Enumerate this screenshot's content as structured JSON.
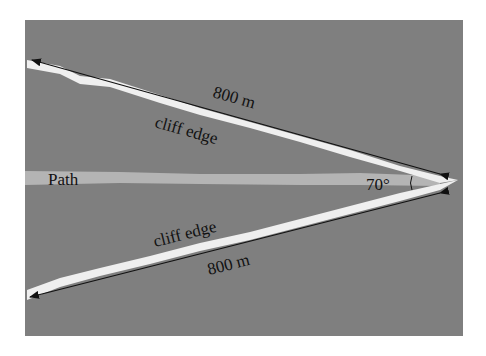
{
  "diagram": {
    "background_color": "#7f7f7f",
    "path_color": "#b4b4b4",
    "edge_color": "#f2f2f2",
    "labels": {
      "top_distance": "800 m",
      "top_edge": "cliff edge",
      "path": "Path",
      "angle": "70°",
      "bottom_edge": "cliff edge",
      "bottom_distance": "800 m"
    }
  }
}
